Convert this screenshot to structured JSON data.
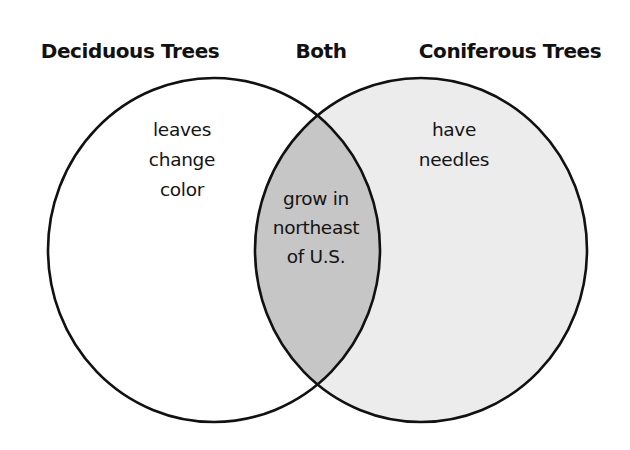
{
  "diagram": {
    "type": "venn",
    "headings": {
      "left": "Deciduous Trees",
      "center": "Both",
      "right": "Coniferous Trees"
    },
    "sets": {
      "left": {
        "name": "Deciduous Trees",
        "lines": [
          "leaves",
          "change",
          "color"
        ]
      },
      "right": {
        "name": "Coniferous Trees",
        "lines": [
          "have",
          "needles"
        ]
      },
      "overlap": {
        "name": "Both",
        "lines": [
          "grow in",
          "northeast",
          "of U.S."
        ]
      }
    },
    "colors": {
      "left_fill": "#ffffff",
      "right_fill": "#ececec",
      "overlap_fill": "#c6c6c6",
      "stroke": "#111111"
    }
  }
}
